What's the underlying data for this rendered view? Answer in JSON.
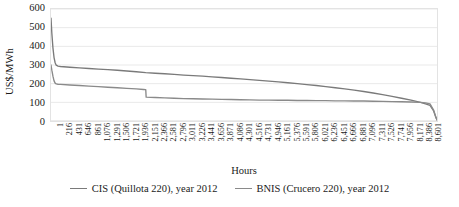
{
  "chart_data": {
    "type": "line",
    "title": "",
    "xlabel": "Hours",
    "ylabel": "US$/MWh",
    "ylim": [
      0,
      600
    ],
    "yticks": [
      0,
      100,
      200,
      300,
      400,
      500,
      600
    ],
    "xlim": [
      1,
      8760
    ],
    "grid": true,
    "legend_position": "bottom",
    "xticks": [
      "1",
      "216",
      "431",
      "646",
      "861",
      "1,076",
      "1,291",
      "1,506",
      "1,721",
      "1,936",
      "2,151",
      "2,366",
      "2,581",
      "2,796",
      "3,011",
      "3,226",
      "3,441",
      "3,656",
      "3,871",
      "4,086",
      "4,301",
      "4,516",
      "4,731",
      "4,946",
      "5,161",
      "5,376",
      "5,591",
      "5,806",
      "6,021",
      "6,236",
      "6,451",
      "6,666",
      "6,881",
      "7,096",
      "7,311",
      "7,526",
      "7,741",
      "7,956",
      "8,171",
      "8,386",
      "8,601"
    ],
    "series": [
      {
        "name": "CIS (Quillota 220), year 2012",
        "color": "#7a7a7a",
        "x": [
          1,
          20,
          45,
          70,
          95,
          120,
          160,
          216,
          431,
          646,
          861,
          1076,
          1291,
          1506,
          1721,
          1936,
          2151,
          2366,
          2581,
          2796,
          3011,
          3226,
          3441,
          3656,
          3871,
          4086,
          4301,
          4516,
          4731,
          4946,
          5161,
          5376,
          5591,
          5806,
          6021,
          6236,
          6451,
          6666,
          6881,
          7096,
          7311,
          7526,
          7741,
          7956,
          8171,
          8386,
          8500,
          8601,
          8680,
          8730,
          8760
        ],
        "values": [
          551,
          470,
          392,
          340,
          312,
          299,
          294,
          292,
          288,
          285,
          281,
          278,
          275,
          272,
          268,
          264,
          259,
          256,
          253,
          250,
          246,
          243,
          240,
          236,
          233,
          229,
          226,
          222,
          218,
          214,
          210,
          205,
          200,
          195,
          190,
          184,
          178,
          172,
          165,
          158,
          150,
          141,
          132,
          122,
          112,
          100,
          92,
          84,
          56,
          22,
          6
        ]
      },
      {
        "name": "BNIS (Crucero 220), year 2012",
        "color": "#8a8a8a",
        "x": [
          1,
          20,
          45,
          70,
          95,
          120,
          160,
          216,
          431,
          646,
          861,
          1076,
          1291,
          1506,
          1721,
          1936,
          2100,
          2151,
          2160,
          2366,
          2581,
          2796,
          3011,
          3226,
          3441,
          3656,
          3871,
          4086,
          4301,
          4516,
          4731,
          4946,
          5161,
          5376,
          5591,
          5806,
          6021,
          6236,
          6451,
          6666,
          6881,
          7096,
          7311,
          7526,
          7741,
          7956,
          8171,
          8386,
          8500,
          8601,
          8680,
          8730,
          8760
        ],
        "values": [
          300,
          272,
          240,
          215,
          203,
          199,
          197,
          196,
          193,
          190,
          187,
          184,
          181,
          178,
          175,
          172,
          169,
          168,
          128,
          126,
          124,
          122,
          120,
          119,
          118,
          117,
          116,
          115,
          114,
          113,
          112,
          112,
          111,
          111,
          110,
          110,
          109,
          109,
          108,
          108,
          107,
          107,
          106,
          105,
          104,
          103,
          102,
          100,
          97,
          92,
          60,
          24,
          6
        ]
      }
    ]
  }
}
